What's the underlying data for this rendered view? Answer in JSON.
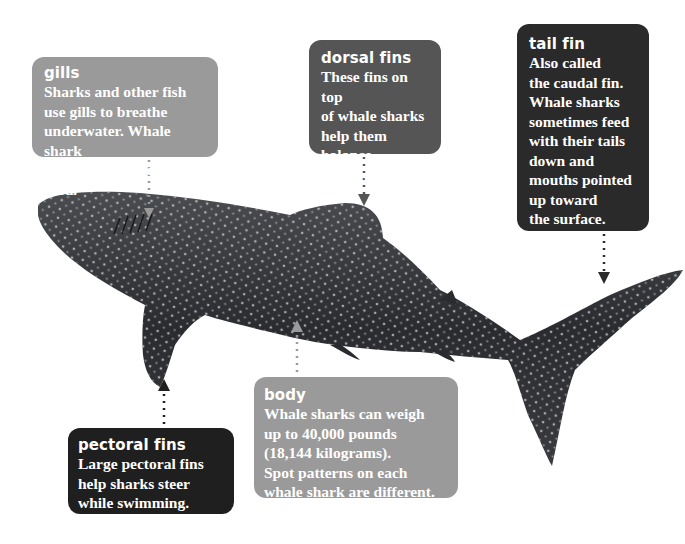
{
  "diagram": {
    "labels": [
      {
        "id": "gills",
        "title": "gills",
        "text": "Sharks and other fish\nuse gills to breathe\nunderwater. Whale shark\ngills catch and filter food.",
        "color": "#9a9a9a"
      },
      {
        "id": "dorsal",
        "title": "dorsal fins",
        "text": "These fins on top\nof whale sharks\nhelp them balance\nin the water.",
        "color": "#555555"
      },
      {
        "id": "tail",
        "title": "tail fin",
        "text": "Also called\nthe caudal fin.\nWhale sharks\nsometimes feed\nwith their tails\ndown and\nmouths pointed\nup toward\nthe surface.",
        "color": "#2a2a2a"
      },
      {
        "id": "pectoral",
        "title": "pectoral fins",
        "text": "Large pectoral fins\nhelp sharks steer\nwhile swimming.",
        "color": "#1f1f1f"
      },
      {
        "id": "body",
        "title": "body",
        "text": "Whale sharks can weigh\nup to 40,000 pounds\n(18,144 kilograms).\nSpot patterns on each\nwhale shark are different.",
        "color": "#9a9a9a"
      }
    ],
    "shark_color": "#2e2f33",
    "spot_color": "#cfd3d6"
  }
}
